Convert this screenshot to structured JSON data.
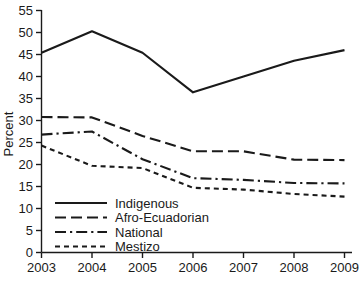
{
  "chart_data": {
    "type": "line",
    "title": "",
    "xlabel": "",
    "ylabel": "Percent",
    "categories": [
      "2003",
      "2004",
      "2005",
      "2006",
      "2007",
      "2008",
      "2009"
    ],
    "x": [
      2003,
      2004,
      2005,
      2006,
      2007,
      2008,
      2009
    ],
    "xlim": [
      2003,
      2009
    ],
    "ylim": [
      0,
      55
    ],
    "yticks": [
      0,
      5,
      10,
      15,
      20,
      25,
      30,
      35,
      40,
      45,
      50,
      55
    ],
    "ytick_labels": [
      "0",
      "5",
      "10",
      "15",
      "20",
      "25",
      "30",
      "35",
      "40",
      "45",
      "50",
      "55"
    ],
    "xticks": [
      2003,
      2004,
      2005,
      2006,
      2007,
      2008,
      2009
    ],
    "xtick_labels": [
      "2003",
      "2004",
      "2005",
      "2006",
      "2007",
      "2008",
      "2009"
    ],
    "grid": false,
    "legend_position": "lower-left",
    "series": [
      {
        "name": "Indigenous",
        "dash": "solid",
        "color": "#1a1a1a",
        "values": [
          45.4,
          50.3,
          45.4,
          36.4,
          40.0,
          43.6,
          46.0
        ]
      },
      {
        "name": "Afro-Ecuadorian",
        "dash": "long-dash",
        "color": "#1a1a1a",
        "values": [
          30.8,
          30.7,
          26.5,
          23.0,
          23.0,
          21.1,
          21.0
        ]
      },
      {
        "name": "National",
        "dash": "dash-dot",
        "color": "#1a1a1a",
        "values": [
          26.8,
          27.5,
          21.2,
          16.9,
          16.5,
          15.8,
          15.7
        ]
      },
      {
        "name": "Mestizo",
        "dash": "short-dash",
        "color": "#1a1a1a",
        "values": [
          24.3,
          19.7,
          19.2,
          14.7,
          14.3,
          13.3,
          12.7
        ]
      }
    ]
  },
  "axes": {
    "y_title": "Percent"
  },
  "legend": {
    "entries": [
      {
        "label": "Indigenous"
      },
      {
        "label": "Afro-Ecuadorian"
      },
      {
        "label": "National"
      },
      {
        "label": "Mestizo"
      }
    ]
  }
}
